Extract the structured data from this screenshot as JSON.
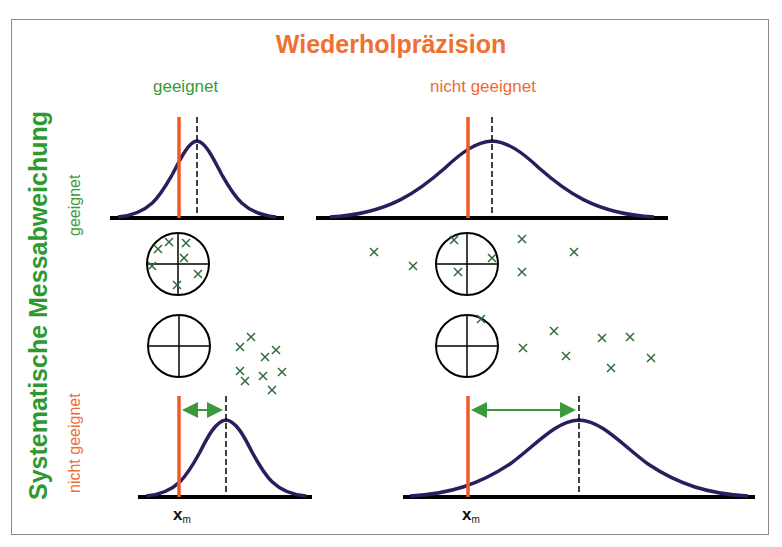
{
  "title": "Wiederholpräzision",
  "columns": [
    {
      "label": "geeignet",
      "color": "#3a9a3a"
    },
    {
      "label": "nicht geeignet",
      "color": "#f06a35"
    }
  ],
  "y_axis": {
    "label": "Systematische Messabweichung",
    "rows": [
      {
        "label": "geeignet",
        "color": "#3a9a3a"
      },
      {
        "label": "nicht geeignet",
        "color": "#f06a35"
      }
    ]
  },
  "reference_label": {
    "main": "x",
    "sub": "m"
  },
  "colors": {
    "curve": "#2a1f5e",
    "reference_line": "#f05a28",
    "arrow": "#3a9a3a",
    "marker": "#2f6a3a",
    "title": "#f07030"
  },
  "panels": [
    {
      "position": "top-left",
      "precision": "geeignet",
      "bias": "geeignet",
      "spread": "narrow",
      "offset": "small",
      "targets": "hits clustered inside target"
    },
    {
      "position": "top-right",
      "precision": "nicht geeignet",
      "bias": "geeignet",
      "spread": "wide",
      "offset": "small",
      "targets": "hits scattered around target"
    },
    {
      "position": "bottom-left",
      "precision": "geeignet",
      "bias": "nicht geeignet",
      "spread": "narrow",
      "offset": "large",
      "targets": "hits clustered outside target"
    },
    {
      "position": "bottom-right",
      "precision": "nicht geeignet",
      "bias": "nicht geeignet",
      "spread": "wide",
      "offset": "large",
      "targets": "hits scattered outside target"
    }
  ]
}
